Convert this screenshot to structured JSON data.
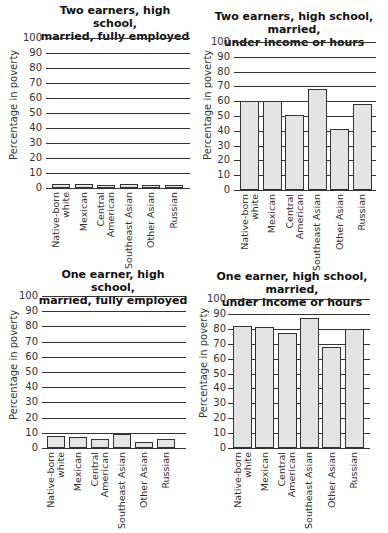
{
  "charts": [
    {
      "id": "two-earners-fully-employed",
      "title_line1": "Two earners, high school,",
      "title_line2": "married, fully employed",
      "ylabel": "Percentage in poverty"
    },
    {
      "id": "two-earners-under",
      "title_line1": "Two earners, high school, married,",
      "title_line2": "under income or hours",
      "ylabel": "Percentage in poverty"
    },
    {
      "id": "one-earner-fully-employed",
      "title_line1": "One earner, high school,",
      "title_line2": "married, fully employed",
      "ylabel": "Percentage in poverty"
    },
    {
      "id": "one-earner-under",
      "title_line1": "One earner, high school, married,",
      "title_line2": "under income or hours",
      "ylabel": "Percentage in poverty"
    }
  ],
  "yticks": [
    "100",
    "90",
    "80",
    "70",
    "60",
    "50",
    "40",
    "30",
    "20",
    "10",
    "0"
  ],
  "categories": [
    "Native-born\n     white",
    "Mexican",
    "Central\nAmerican",
    "Southeast Asian",
    "Other Asian",
    "Russian"
  ],
  "chart_data": [
    {
      "type": "bar",
      "title": "Two earners, high school, married, fully employed",
      "xlabel": "",
      "ylabel": "Percentage in poverty",
      "ylim": [
        0,
        100
      ],
      "yticks": [
        0,
        10,
        20,
        30,
        40,
        50,
        60,
        70,
        80,
        90,
        100
      ],
      "grid": true,
      "categories": [
        "Native-born white",
        "Mexican",
        "Central American",
        "Southeast Asian",
        "Other Asian",
        "Russian"
      ],
      "values": [
        3,
        2.5,
        2,
        2.5,
        1.5,
        2
      ]
    },
    {
      "type": "bar",
      "title": "Two earners, high school, married, under income or hours",
      "xlabel": "",
      "ylabel": "Percentage in poverty",
      "ylim": [
        0,
        100
      ],
      "yticks": [
        0,
        10,
        20,
        30,
        40,
        50,
        60,
        70,
        80,
        90,
        100
      ],
      "grid": true,
      "categories": [
        "Native-born white",
        "Mexican",
        "Central American",
        "Southeast Asian",
        "Other Asian",
        "Russian"
      ],
      "values": [
        60,
        60,
        51,
        68,
        41,
        58
      ]
    },
    {
      "type": "bar",
      "title": "One earner, high school, married, fully employed",
      "xlabel": "",
      "ylabel": "Percentage in poverty",
      "ylim": [
        0,
        100
      ],
      "yticks": [
        0,
        10,
        20,
        30,
        40,
        50,
        60,
        70,
        80,
        90,
        100
      ],
      "grid": true,
      "categories": [
        "Native-born white",
        "Mexican",
        "Central American",
        "Southeast Asian",
        "Other Asian",
        "Russian"
      ],
      "values": [
        8,
        7.5,
        6,
        9,
        4,
        6
      ]
    },
    {
      "type": "bar",
      "title": "One earner, high school, married, under income or hours",
      "xlabel": "",
      "ylabel": "Percentage in poverty",
      "ylim": [
        0,
        100
      ],
      "yticks": [
        0,
        10,
        20,
        30,
        40,
        50,
        60,
        70,
        80,
        90,
        100
      ],
      "grid": true,
      "categories": [
        "Native-born white",
        "Mexican",
        "Central American",
        "Southeast Asian",
        "Other Asian",
        "Russian"
      ],
      "values": [
        82,
        81,
        77,
        87,
        68,
        80
      ]
    }
  ]
}
